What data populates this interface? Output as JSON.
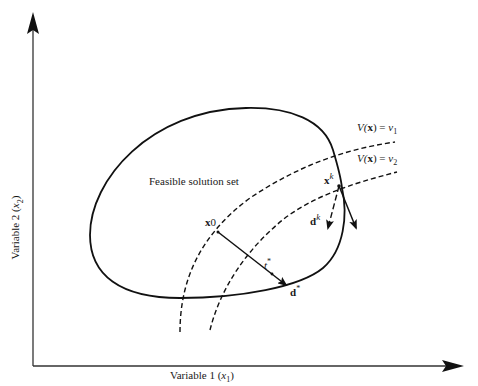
{
  "diagram": {
    "axes": {
      "x_label_text": "Variable 1 (",
      "x_label_var": "x",
      "x_label_sub": "1",
      "x_label_close": ")",
      "y_label_text": "Variable 2 (",
      "y_label_var": "x",
      "y_label_sub": "2",
      "y_label_close": ")"
    },
    "region_label": "Feasible solution set",
    "contours": [
      {
        "func": "V(",
        "arg": "x",
        "close": ") = ",
        "value": "v",
        "sub": "1"
      },
      {
        "func": "V(",
        "arg": "x",
        "close": ") = ",
        "value": "v",
        "sub": "2"
      }
    ],
    "points": {
      "x0": {
        "base": "x",
        "sup": "0"
      },
      "xk": {
        "base": "x",
        "sup": "k"
      },
      "tstar": {
        "base": "t",
        "sup": "*"
      }
    },
    "directions": {
      "dstar": {
        "base": "d",
        "sup": "*"
      },
      "dk": {
        "base": "d",
        "sup": "k"
      }
    },
    "colors": {
      "line": "#111111",
      "background": "#ffffff"
    }
  }
}
